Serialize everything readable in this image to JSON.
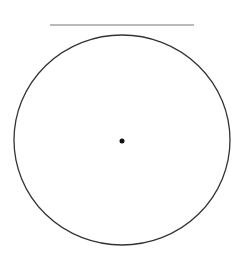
{
  "diagram": {
    "line": {
      "x1": 50,
      "y1": 25,
      "x2": 194,
      "y2": 25,
      "color": "#777777"
    },
    "circle": {
      "cx": 122,
      "cy": 140,
      "rx": 108,
      "ry": 105,
      "stroke": "#333333"
    },
    "center_point": {
      "cx": 122,
      "cy": 141,
      "r": 2.5,
      "color": "#111111"
    }
  }
}
